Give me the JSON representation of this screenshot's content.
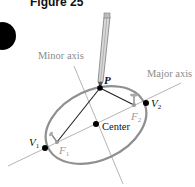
{
  "figure": {
    "label": "Figure 25"
  },
  "diagram": {
    "labels": {
      "minor_axis": "Minor axis",
      "major_axis": "Major axis",
      "point_p": "P",
      "center": "Center",
      "v1_main": "V",
      "v1_sub": "1",
      "v2_main": "V",
      "v2_sub": "2",
      "f1_main": "F",
      "f1_sub": "1",
      "f2_main": "F",
      "f2_sub": "2"
    },
    "colors": {
      "ellipse": "#8a8a8a",
      "axis_lines": "#b0b0b0",
      "axis_text": "#8c8c8c",
      "focus_text": "#9a9a9a",
      "string_lines": "#1a1a1a",
      "points": "#000000"
    }
  }
}
